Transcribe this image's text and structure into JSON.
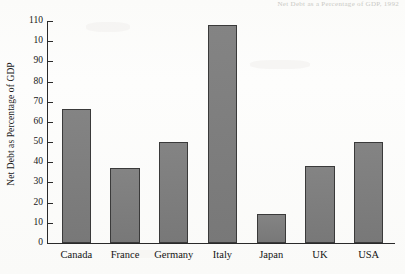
{
  "scan": {
    "caption_fragment": "Net Debt as a Percentage of GDP, 1992"
  },
  "chart_data": {
    "type": "bar",
    "title": "",
    "xlabel": "",
    "ylabel": "Net Debt as Percentage of GDP",
    "categories": [
      "Canada",
      "France",
      "Germany",
      "Italy",
      "Japan",
      "UK",
      "USA"
    ],
    "values": [
      66,
      37,
      50,
      108,
      14,
      38,
      50
    ],
    "ylim": [
      0,
      110
    ],
    "ytick_values": [
      0,
      10,
      20,
      30,
      40,
      50,
      60,
      70,
      80,
      90,
      100,
      110
    ],
    "ytick_labels": [
      "0",
      "10",
      "20",
      "30",
      "40",
      "50",
      "60",
      "70",
      "80",
      "90",
      "10",
      "110"
    ],
    "grid": false,
    "legend": false,
    "bar_color": "#7d7d7d",
    "bar_edge_color": "#3a3a3a",
    "axis_color": "#2a2a2a",
    "background_color": "#fdfdfb"
  }
}
